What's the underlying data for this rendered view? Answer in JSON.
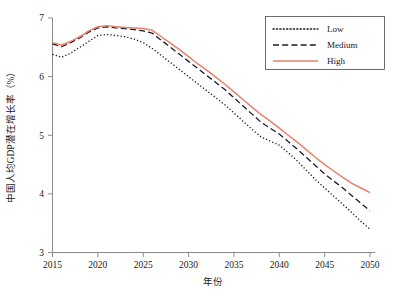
{
  "chart_data": {
    "type": "line",
    "title": "",
    "xlabel": "年份",
    "ylabel": "中国人均GDP潜在增长率（%）",
    "xlim": [
      2015,
      2050
    ],
    "ylim": [
      3,
      7
    ],
    "grid": false,
    "legend_position": "top-right",
    "x_ticks": [
      "2015",
      "2020",
      "2025",
      "2030",
      "2035",
      "2040",
      "2045",
      "2050"
    ],
    "x_tick_values": [
      2015,
      2020,
      2025,
      2030,
      2035,
      2040,
      2045,
      2050
    ],
    "y_ticks": [
      "3",
      "4",
      "5",
      "6",
      "7"
    ],
    "y_tick_values": [
      3,
      4,
      5,
      6,
      7
    ],
    "x": [
      2015,
      2016,
      2017,
      2018,
      2019,
      2020,
      2021,
      2022,
      2023,
      2024,
      2025,
      2026,
      2027,
      2028,
      2029,
      2030,
      2031,
      2032,
      2033,
      2034,
      2035,
      2036,
      2037,
      2038,
      2039,
      2040,
      2041,
      2042,
      2043,
      2044,
      2045,
      2046,
      2047,
      2048,
      2049,
      2050
    ],
    "series": [
      {
        "name": "Low",
        "color": "#1a1a2e",
        "style": "dotted",
        "values": [
          6.38,
          6.33,
          6.4,
          6.5,
          6.6,
          6.7,
          6.72,
          6.7,
          6.68,
          6.64,
          6.58,
          6.48,
          6.36,
          6.24,
          6.12,
          6.0,
          5.88,
          5.76,
          5.64,
          5.52,
          5.38,
          5.24,
          5.1,
          4.97,
          4.9,
          4.83,
          4.7,
          4.56,
          4.4,
          4.24,
          4.1,
          3.96,
          3.82,
          3.68,
          3.53,
          3.4
        ]
      },
      {
        "name": "Medium",
        "color": "#1a1a2e",
        "style": "dashed",
        "values": [
          6.56,
          6.51,
          6.58,
          6.66,
          6.76,
          6.83,
          6.85,
          6.83,
          6.82,
          6.8,
          6.78,
          6.74,
          6.62,
          6.5,
          6.38,
          6.26,
          6.14,
          6.02,
          5.9,
          5.78,
          5.64,
          5.5,
          5.36,
          5.22,
          5.12,
          5.02,
          4.89,
          4.76,
          4.62,
          4.48,
          4.34,
          4.22,
          4.1,
          3.97,
          3.84,
          3.71
        ]
      },
      {
        "name": "High",
        "color": "#E8806A",
        "style": "solid",
        "values": [
          6.58,
          6.54,
          6.6,
          6.68,
          6.78,
          6.85,
          6.87,
          6.85,
          6.84,
          6.83,
          6.82,
          6.79,
          6.68,
          6.57,
          6.46,
          6.34,
          6.22,
          6.11,
          5.99,
          5.87,
          5.74,
          5.61,
          5.48,
          5.35,
          5.24,
          5.12,
          5.0,
          4.88,
          4.75,
          4.62,
          4.5,
          4.39,
          4.28,
          4.18,
          4.1,
          4.02
        ]
      }
    ]
  },
  "legend": {
    "items": [
      {
        "label": "Low"
      },
      {
        "label": "Medium"
      },
      {
        "label": "High"
      }
    ]
  },
  "caption": {
    "text": ""
  }
}
